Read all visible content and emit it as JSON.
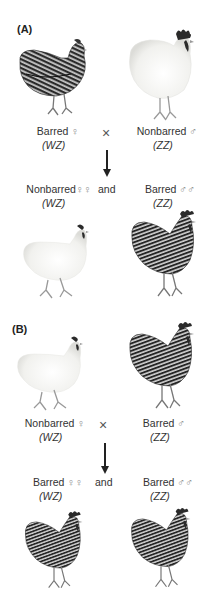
{
  "panels": [
    {
      "label": "(A)",
      "parents": {
        "left": {
          "phenotype": "Barred",
          "sex_symbol": "♀",
          "genotype": "(WZ)",
          "plumage": "barred",
          "bird": "hen"
        },
        "cross_symbol": "×",
        "right": {
          "phenotype": "Nonbarred",
          "sex_symbol": "♂",
          "genotype": "(ZZ)",
          "plumage": "white",
          "bird": "rooster"
        }
      },
      "offspring": {
        "left": {
          "phenotype": "Nonbarred",
          "sex_symbol": "♀♀",
          "genotype": "(WZ)",
          "plumage": "white",
          "bird": "hen"
        },
        "conjunction": "and",
        "right": {
          "phenotype": "Barred",
          "sex_symbol": "♂♂",
          "genotype": "(ZZ)",
          "plumage": "barred",
          "bird": "rooster"
        }
      }
    },
    {
      "label": "(B)",
      "parents": {
        "left": {
          "phenotype": "Nonbarred",
          "sex_symbol": "♀",
          "genotype": "(WZ)",
          "plumage": "white",
          "bird": "hen"
        },
        "cross_symbol": "×",
        "right": {
          "phenotype": "Barred",
          "sex_symbol": "♂",
          "genotype": "(ZZ)",
          "plumage": "barred",
          "bird": "rooster"
        }
      },
      "offspring": {
        "left": {
          "phenotype": "Barred",
          "sex_symbol": "♀♀",
          "genotype": "(WZ)",
          "plumage": "barred",
          "bird": "rooster"
        },
        "conjunction": "and",
        "right": {
          "phenotype": "Barred",
          "sex_symbol": "♂♂",
          "genotype": "(ZZ)",
          "plumage": "barred",
          "bird": "rooster"
        }
      }
    }
  ],
  "colors": {
    "barred_dark": "#2b2b2b",
    "barred_light": "#bdbdbd",
    "white_body": "#f4f4f2",
    "comb": "#2a2a2a",
    "text": "#333333"
  }
}
